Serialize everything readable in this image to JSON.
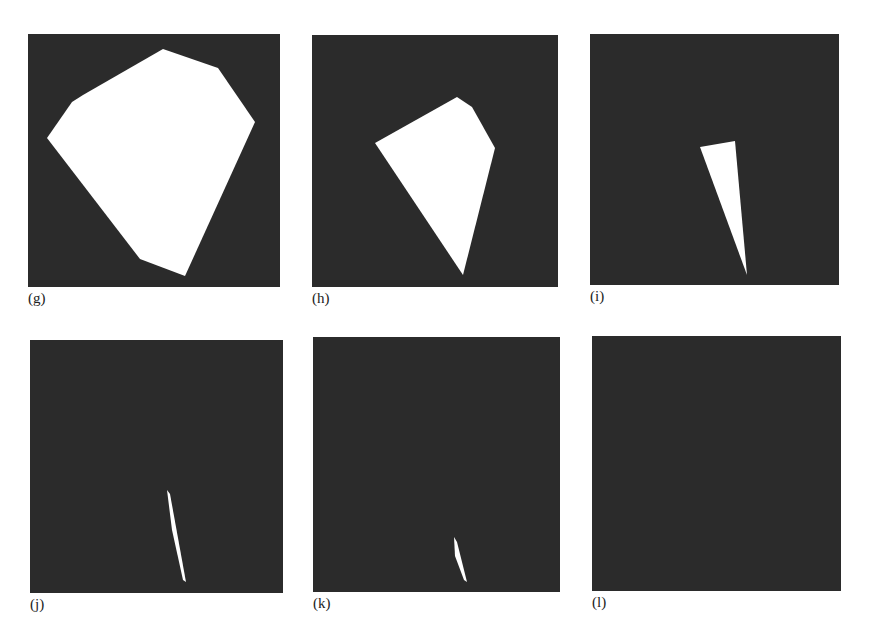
{
  "figure": {
    "background": "#ffffff",
    "panel_color": "#2b2b2b",
    "shape_color": "#ffffff",
    "panels": [
      {
        "id": "g",
        "label": "(g)",
        "x": 28,
        "y": 34,
        "w": 252,
        "h": 253,
        "polygon": "163,49 218,68 255,122 185,276 140,259 47,138 72,102 83,95"
      },
      {
        "id": "h",
        "label": "(h)",
        "x": 312,
        "y": 35,
        "w": 246,
        "h": 252,
        "polygon": "457,97 472,107 495,148 463,275 375,143"
      },
      {
        "id": "i",
        "label": "(i)",
        "x": 590,
        "y": 34,
        "w": 249,
        "h": 251,
        "polygon": "700,147 735,141 747,275"
      },
      {
        "id": "j",
        "label": "(j)",
        "x": 30,
        "y": 340,
        "w": 253,
        "h": 253,
        "polygon": "167,490 170,494 186,582 183,580 172,530"
      },
      {
        "id": "k",
        "label": "(k)",
        "x": 313,
        "y": 337,
        "w": 247,
        "h": 255,
        "polygon": "454,537 457,542 467,582 464,580 455,556"
      },
      {
        "id": "l",
        "label": "(l)",
        "x": 592,
        "y": 336,
        "w": 249,
        "h": 255,
        "polygon": ""
      }
    ]
  }
}
